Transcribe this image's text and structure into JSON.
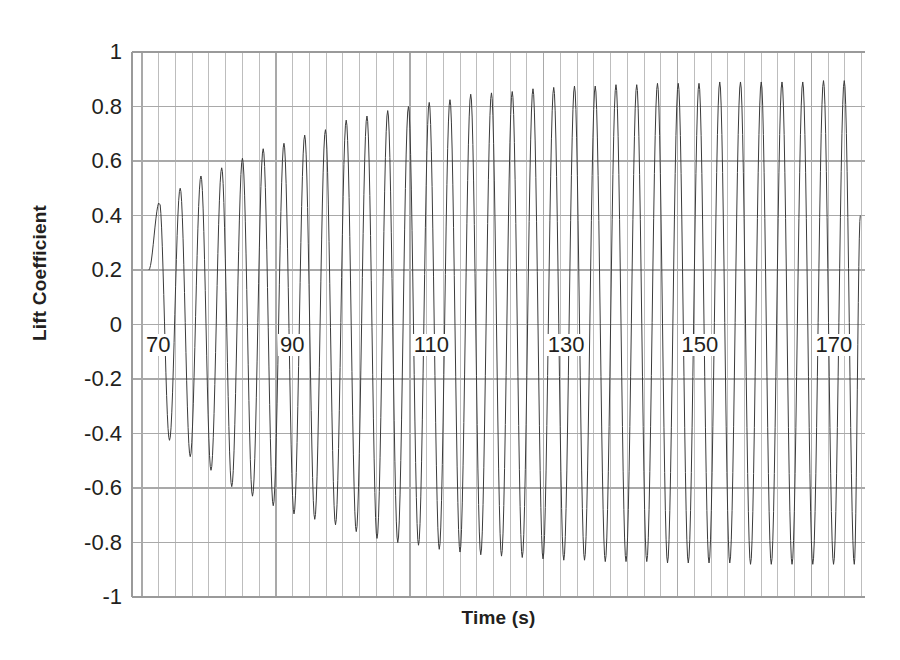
{
  "chart_data": {
    "type": "line",
    "title": "",
    "xlabel": "Time (s)",
    "ylabel": "Lift Coefficient",
    "xlim": [
      68.5,
      178.0
    ],
    "ylim": [
      -1,
      1
    ],
    "grid": true,
    "legend": "none",
    "x_ticks": [
      70,
      90,
      110,
      130,
      150,
      170
    ],
    "x_tick_labels": [
      "70",
      "90",
      "110",
      "130",
      "150",
      "170"
    ],
    "x_minor_gridline_step": 2.5,
    "y_ticks": [
      -1,
      -0.8,
      -0.6,
      -0.4,
      -0.2,
      0,
      0.2,
      0.4,
      0.6,
      0.8,
      1
    ],
    "y_tick_labels": [
      "-1",
      "-0.8",
      "-0.6",
      "-0.4",
      "-0.2",
      "0",
      "0.2",
      "0.4",
      "0.6",
      "0.8",
      "1"
    ],
    "series": [
      {
        "name": "Lift Coefficient",
        "color": "#3b3b3b",
        "line_width": 1,
        "description": "Growing self-excited oscillation saturating to a limit cycle",
        "start_time": 71.0,
        "end_time": 177.3,
        "start_value": 0.2,
        "period": 3.12,
        "phase_offset": 0.0,
        "amplitude_initial": 0.42,
        "amplitude_saturated": 0.885,
        "growth_rate": 0.052,
        "mean_offset": 0.01,
        "peaks": [
          {
            "t": 72.6,
            "value": 0.45
          },
          {
            "t": 75.7,
            "value": 0.5
          },
          {
            "t": 78.8,
            "value": 0.545
          },
          {
            "t": 81.9,
            "value": 0.575
          },
          {
            "t": 85.0,
            "value": 0.61
          },
          {
            "t": 88.1,
            "value": 0.645
          },
          {
            "t": 91.2,
            "value": 0.665
          },
          {
            "t": 94.3,
            "value": 0.695
          },
          {
            "t": 97.4,
            "value": 0.715
          },
          {
            "t": 100.5,
            "value": 0.75
          },
          {
            "t": 103.6,
            "value": 0.765
          },
          {
            "t": 106.7,
            "value": 0.785
          },
          {
            "t": 109.8,
            "value": 0.8
          },
          {
            "t": 112.9,
            "value": 0.815
          },
          {
            "t": 116.0,
            "value": 0.825
          },
          {
            "t": 119.1,
            "value": 0.845
          },
          {
            "t": 122.2,
            "value": 0.85
          },
          {
            "t": 125.3,
            "value": 0.855
          },
          {
            "t": 128.4,
            "value": 0.865
          },
          {
            "t": 131.5,
            "value": 0.87
          },
          {
            "t": 134.6,
            "value": 0.875
          },
          {
            "t": 137.7,
            "value": 0.875
          },
          {
            "t": 140.8,
            "value": 0.88
          },
          {
            "t": 143.9,
            "value": 0.88
          },
          {
            "t": 147.0,
            "value": 0.885
          },
          {
            "t": 150.1,
            "value": 0.885
          },
          {
            "t": 153.2,
            "value": 0.885
          },
          {
            "t": 156.3,
            "value": 0.89
          },
          {
            "t": 159.4,
            "value": 0.89
          },
          {
            "t": 162.5,
            "value": 0.89
          },
          {
            "t": 165.6,
            "value": 0.89
          },
          {
            "t": 168.7,
            "value": 0.89
          },
          {
            "t": 171.8,
            "value": 0.895
          },
          {
            "t": 174.9,
            "value": 0.895
          }
        ],
        "troughs": [
          {
            "t": 74.1,
            "value": -0.425
          },
          {
            "t": 77.2,
            "value": -0.485
          },
          {
            "t": 80.3,
            "value": -0.535
          },
          {
            "t": 83.4,
            "value": -0.595
          },
          {
            "t": 86.5,
            "value": -0.63
          },
          {
            "t": 89.6,
            "value": -0.665
          },
          {
            "t": 92.7,
            "value": -0.695
          },
          {
            "t": 95.8,
            "value": -0.715
          },
          {
            "t": 98.9,
            "value": -0.735
          },
          {
            "t": 102.0,
            "value": -0.76
          },
          {
            "t": 105.1,
            "value": -0.785
          },
          {
            "t": 108.2,
            "value": -0.8
          },
          {
            "t": 111.3,
            "value": -0.81
          },
          {
            "t": 114.4,
            "value": -0.825
          },
          {
            "t": 117.5,
            "value": -0.835
          },
          {
            "t": 120.6,
            "value": -0.845
          },
          {
            "t": 123.7,
            "value": -0.85
          },
          {
            "t": 126.8,
            "value": -0.855
          },
          {
            "t": 129.9,
            "value": -0.86
          },
          {
            "t": 133.0,
            "value": -0.865
          },
          {
            "t": 136.1,
            "value": -0.865
          },
          {
            "t": 139.2,
            "value": -0.87
          },
          {
            "t": 142.3,
            "value": -0.87
          },
          {
            "t": 145.4,
            "value": -0.87
          },
          {
            "t": 148.5,
            "value": -0.875
          },
          {
            "t": 151.6,
            "value": -0.875
          },
          {
            "t": 154.7,
            "value": -0.875
          },
          {
            "t": 157.8,
            "value": -0.875
          },
          {
            "t": 160.9,
            "value": -0.88
          },
          {
            "t": 164.0,
            "value": -0.88
          },
          {
            "t": 167.1,
            "value": -0.88
          },
          {
            "t": 170.2,
            "value": -0.88
          },
          {
            "t": 173.3,
            "value": -0.88
          },
          {
            "t": 176.4,
            "value": -0.88
          }
        ]
      }
    ]
  },
  "style": {
    "plot_left": 132,
    "plot_right": 865,
    "plot_top": 52,
    "plot_bottom": 597,
    "grid_color": "#a9a9a9",
    "minor_grid_color": "#bdbdbd",
    "axis_color": "#9a9a9a",
    "line_color": "#3b3b3b",
    "background": "#ffffff",
    "text_color": "#231f20"
  }
}
